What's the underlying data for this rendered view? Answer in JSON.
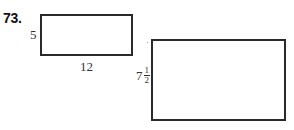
{
  "problem": {
    "number": "73."
  },
  "figures": {
    "rectangle_a": {
      "height_label": "5",
      "width_label": "12"
    },
    "rectangle_b": {
      "height_label": {
        "whole": "7",
        "numerator": "1",
        "denominator": "2"
      },
      "width_label": ""
    }
  },
  "colors": {
    "stroke": "#2a2a2a",
    "text": "#1a1a1a",
    "background": "#ffffff"
  }
}
